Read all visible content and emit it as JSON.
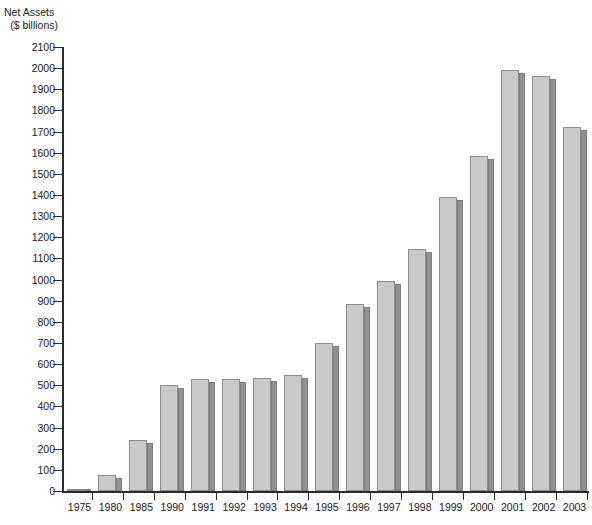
{
  "chart_data": {
    "type": "bar",
    "title": "",
    "subtitle": "",
    "xlabel": "",
    "ylabel": "Net Assets ($ billions)",
    "ylabel_line1": "Net Assets",
    "ylabel_line2": "($ billions)",
    "ylim": [
      0,
      2100
    ],
    "ytick_step": 100,
    "grid": false,
    "legend": null,
    "categories": [
      "1975",
      "1980",
      "1985",
      "1990",
      "1991",
      "1992",
      "1993",
      "1994",
      "1995",
      "1996",
      "1997",
      "1998",
      "1999",
      "2000",
      "2001",
      "2002",
      "2003"
    ],
    "values": [
      10,
      75,
      240,
      500,
      530,
      530,
      535,
      550,
      700,
      885,
      995,
      1145,
      1390,
      1585,
      1990,
      1965,
      1720
    ],
    "ytick_labels": [
      "2100",
      "2000",
      "1900",
      "1800",
      "1700",
      "1600",
      "1500",
      "1400",
      "1300",
      "1200",
      "1100",
      "1000",
      "900",
      "800",
      "700",
      "600",
      "500",
      "400",
      "300",
      "200",
      "100",
      "0"
    ],
    "bar_face_color": "#c9c9c9",
    "bar_side_color": "#919191",
    "axis_color": "#2b2b2b",
    "background_color": "#ffffff"
  }
}
